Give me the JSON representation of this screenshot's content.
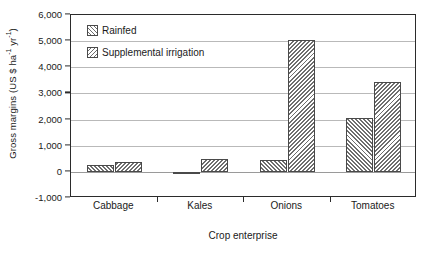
{
  "chart_data": {
    "type": "bar",
    "title": "",
    "subtitle": "",
    "xlabel": "Crop enterprise",
    "ylabel": "Gross margins (US $ ha⁻¹ yr⁻¹)",
    "ylabel_parts": {
      "prefix": "Gross margins (US $ ha",
      "sup1": "-1",
      "mid": " yr",
      "sup2": "-1",
      "suffix": ")"
    },
    "categories": [
      "Cabbage",
      "Kales",
      "Onions",
      "Tomatoes"
    ],
    "series": [
      {
        "name": "Rainfed",
        "pattern": "forward-hatch",
        "values": [
          280,
          -100,
          450,
          2050
        ]
      },
      {
        "name": "Supplemental irrigation",
        "pattern": "backward-hatch",
        "values": [
          370,
          500,
          5050,
          3450
        ]
      }
    ],
    "ylim": [
      -1000,
      6000
    ],
    "yticks": [
      -1000,
      0,
      1000,
      2000,
      3000,
      4000,
      5000,
      6000
    ],
    "ytick_labels": [
      "-1,000",
      "0",
      "1,000",
      "2,000",
      "3,000",
      "4,000",
      "5,000",
      "6,000"
    ],
    "grid": "horizontal",
    "legend_position": "upper-left-inside",
    "frame": "full-box",
    "colors": {
      "hatch": "#6e6e6e",
      "bar_edge": "#4a4a4a",
      "axis": "#2b2b2b",
      "gridline": "#b9b9b9",
      "background": "#ffffff",
      "text": "#1a1a1a"
    }
  }
}
